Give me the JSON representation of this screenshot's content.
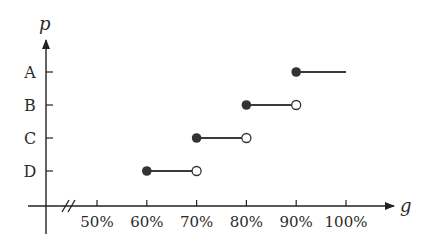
{
  "chart_data": {
    "type": "step",
    "title": "",
    "xlabel": "g",
    "ylabel": "p",
    "x_ticks": [
      "50%",
      "60%",
      "70%",
      "80%",
      "90%",
      "100%"
    ],
    "x_tick_values": [
      50,
      60,
      70,
      80,
      90,
      100
    ],
    "y_categories": [
      "A",
      "B",
      "C",
      "D"
    ],
    "axis_break": true,
    "xlim": [
      50,
      100
    ],
    "segments": [
      {
        "category": "D",
        "x_start": 60,
        "x_end": 70,
        "start_closed": true,
        "end_closed": false
      },
      {
        "category": "C",
        "x_start": 70,
        "x_end": 80,
        "start_closed": true,
        "end_closed": false
      },
      {
        "category": "B",
        "x_start": 80,
        "x_end": 90,
        "start_closed": true,
        "end_closed": false
      },
      {
        "category": "A",
        "x_start": 90,
        "x_end": 100,
        "start_closed": true,
        "end_closed": null
      }
    ],
    "grid": false,
    "colors": {
      "line": "#3a3a3a",
      "point": "#333333"
    }
  }
}
